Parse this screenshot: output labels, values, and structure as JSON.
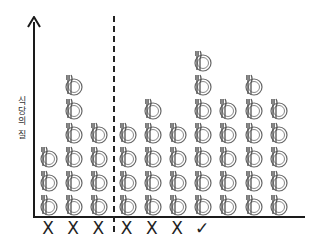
{
  "diagram": {
    "y_axis_label": "식당의 질",
    "icon": "plate-fork-knife-icon",
    "columns": [
      {
        "count": 3,
        "marker": "X"
      },
      {
        "count": 6,
        "marker": "X"
      },
      {
        "count": 4,
        "marker": "X"
      },
      {
        "count": 4,
        "marker": "X"
      },
      {
        "count": 5,
        "marker": "X"
      },
      {
        "count": 4,
        "marker": "X"
      },
      {
        "count": 7,
        "marker": "✓"
      },
      {
        "count": 5,
        "marker": ""
      },
      {
        "count": 6,
        "marker": ""
      },
      {
        "count": 5,
        "marker": ""
      }
    ],
    "divider_after_column": 3
  },
  "chart_data": {
    "type": "bar",
    "title": "",
    "xlabel": "",
    "ylabel": "식당의 질",
    "categories": [
      "1",
      "2",
      "3",
      "4",
      "5",
      "6",
      "7",
      "8",
      "9",
      "10"
    ],
    "values": [
      3,
      6,
      4,
      4,
      5,
      4,
      7,
      5,
      6,
      5
    ],
    "markers": [
      "X",
      "X",
      "X",
      "X",
      "X",
      "X",
      "✓",
      "",
      "",
      ""
    ],
    "divider": "dashed vertical line between column 3 and column 4",
    "unit_icon": "plate with fork and knife"
  }
}
